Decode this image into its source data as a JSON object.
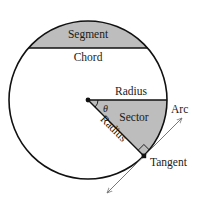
{
  "diagram": {
    "labels": {
      "segment": "Segment",
      "chord": "Chord",
      "radius_horizontal": "Radius",
      "radius_diagonal": "Radius",
      "sector": "Sector",
      "arc": "Arc",
      "tangent": "Tangent",
      "angle": "θ"
    },
    "colors": {
      "stroke": "#111111",
      "fill_gray": "#bdbdbd",
      "tangent_line": "#777777",
      "background": "#ffffff"
    },
    "geometry": {
      "center": [
        88,
        100
      ],
      "radius": 79,
      "chord_y": 48,
      "sector_angle_deg": 45,
      "tangent_point": [
        144,
        156
      ]
    }
  }
}
